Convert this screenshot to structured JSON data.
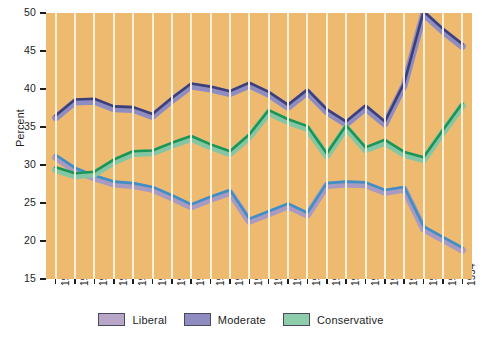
{
  "chart_data": {
    "type": "line",
    "title": "",
    "xlabel": "",
    "ylabel": "Percent",
    "ylim": [
      15,
      50
    ],
    "yticks": [
      15,
      20,
      25,
      30,
      35,
      40,
      45,
      50
    ],
    "grid": "vertical",
    "legend_position": "bottom",
    "categories": [
      "1973",
      "1974",
      "1975",
      "1976",
      "1977",
      "1978",
      "1979",
      "1980",
      "1981",
      "1982",
      "1983",
      "1984",
      "1985",
      "1986",
      "1987",
      "1988",
      "1989",
      "1990",
      "1991",
      "1992",
      "1993",
      "1994"
    ],
    "series": [
      {
        "name": "Liberal",
        "color": "#a89ac0",
        "edge_color": "#3f8fc4",
        "values": [
          31.0,
          29.3,
          28.3,
          27.5,
          27.3,
          26.8,
          25.7,
          24.5,
          25.5,
          26.4,
          22.6,
          23.6,
          24.6,
          23.4,
          27.3,
          27.5,
          27.4,
          26.4,
          26.8,
          21.6,
          20.2,
          18.8
        ]
      },
      {
        "name": "Moderate",
        "color": "#8e8cc0",
        "edge_color": "#3d3f79",
        "values": [
          36.2,
          38.3,
          38.4,
          37.4,
          37.3,
          36.4,
          38.5,
          40.4,
          40.0,
          39.4,
          40.5,
          39.3,
          37.6,
          39.6,
          37.0,
          35.4,
          37.5,
          35.4,
          40.5,
          49.9,
          47.6,
          45.6
        ]
      },
      {
        "name": "Conservative",
        "color": "#84c6a4",
        "edge_color": "#1c9456",
        "values": [
          29.4,
          28.6,
          28.8,
          30.4,
          31.5,
          31.6,
          32.6,
          33.5,
          32.4,
          31.5,
          33.7,
          36.9,
          35.7,
          34.8,
          31.2,
          34.9,
          32.0,
          33.0,
          31.4,
          30.7,
          34.3,
          37.8
        ]
      }
    ]
  },
  "axes": {
    "y_title": "Percent",
    "y_tick_labels": [
      "50",
      "45",
      "40",
      "35",
      "30",
      "25",
      "20",
      "15"
    ],
    "x_tick_labels": [
      "1973",
      "1974",
      "1975",
      "1976",
      "1977",
      "1978",
      "1979",
      "1980",
      "1981",
      "1982",
      "1983",
      "1984",
      "1985",
      "1986",
      "1987",
      "1988",
      "1989",
      "1990",
      "1991",
      "1992",
      "1993",
      "1994"
    ]
  },
  "legend": {
    "items": [
      {
        "label": "Liberal",
        "fill": "#b8a6c8",
        "border": "#4a4a5c"
      },
      {
        "label": "Moderate",
        "fill": "#8e8cc0",
        "border": "#4a4a5c"
      },
      {
        "label": "Conservative",
        "fill": "#8ecdab",
        "border": "#4a4a5c"
      }
    ]
  },
  "colors": {
    "plot_background": "#eeba70",
    "gridline": "#fdf4e2",
    "page_background": "#ffffff",
    "text": "#1d1d1d"
  }
}
